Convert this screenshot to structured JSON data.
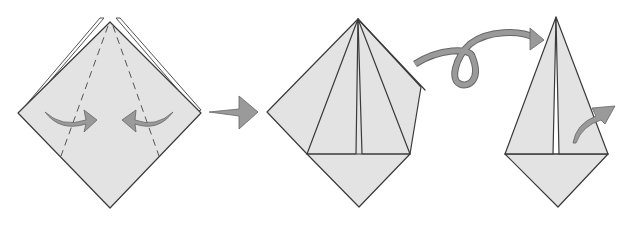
{
  "diagram": {
    "title": "",
    "type": "origami-instruction-sequence",
    "colors": {
      "paper": "#e3e3e3",
      "outline": "#3a3a3a",
      "arrow_fill": "#9a9a9a",
      "arrow_stroke": "#666666",
      "background": "#ffffff"
    },
    "steps": [
      {
        "id": "step-1",
        "description": "Diamond base with layered top; valley-fold both sides to the center along dashed lines",
        "arrows": [
          "fold-in-left",
          "fold-in-right"
        ],
        "lines": [
          "dashed-valley-left",
          "dashed-valley-right"
        ]
      },
      {
        "id": "step-2",
        "description": "Sides folded to center, forming a kite over a diamond",
        "arrows": []
      },
      {
        "id": "step-3",
        "description": "Turn over result; narrow kite with fold arrow on right flap",
        "arrows": [
          "fold-out-right"
        ]
      }
    ],
    "transitions": [
      {
        "from": "step-1",
        "to": "step-2",
        "symbol": "next-step-arrow"
      },
      {
        "from": "step-2",
        "to": "step-3",
        "symbol": "turn-over-loop-arrow"
      }
    ]
  }
}
